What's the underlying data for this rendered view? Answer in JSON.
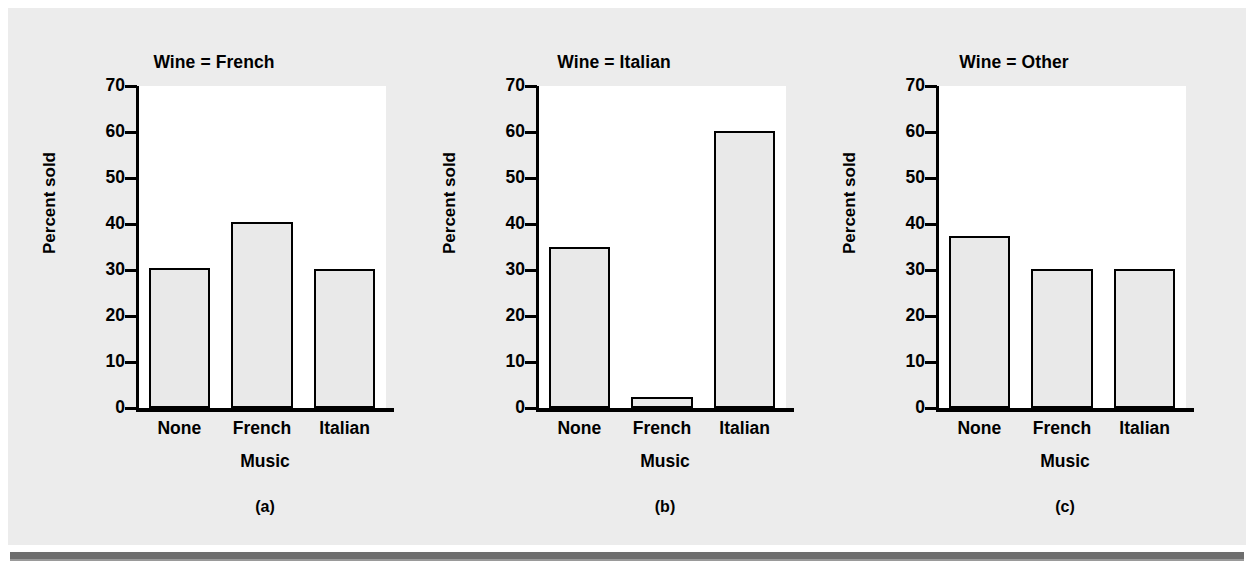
{
  "figure": {
    "background_color": "#ececec",
    "rule_color": "#6e6e6e"
  },
  "chart_data": [
    {
      "type": "bar",
      "title": "Wine = French",
      "panel_letter": "(a)",
      "xlabel": "Music",
      "ylabel": "Percent sold",
      "categories": [
        "None",
        "French",
        "Italian"
      ],
      "values": [
        30.5,
        40.5,
        30.3
      ],
      "ylim": [
        0,
        70
      ],
      "yticks": [
        0,
        10,
        20,
        30,
        40,
        50,
        60,
        70
      ],
      "grid": false,
      "legend": "none",
      "bar_fill": "#e9e9e9",
      "bar_edge": "#000000"
    },
    {
      "type": "bar",
      "title": "Wine = Italian",
      "panel_letter": "(b)",
      "xlabel": "Music",
      "ylabel": "Percent sold",
      "categories": [
        "None",
        "French",
        "Italian"
      ],
      "values": [
        35.0,
        2.5,
        60.3
      ],
      "ylim": [
        0,
        70
      ],
      "yticks": [
        0,
        10,
        20,
        30,
        40,
        50,
        60,
        70
      ],
      "grid": false,
      "legend": "none",
      "bar_fill": "#e9e9e9",
      "bar_edge": "#000000"
    },
    {
      "type": "bar",
      "title": "Wine = Other",
      "panel_letter": "(c)",
      "xlabel": "Music",
      "ylabel": "Percent sold",
      "categories": [
        "None",
        "French",
        "Italian"
      ],
      "values": [
        37.5,
        30.3,
        30.2
      ],
      "ylim": [
        0,
        70
      ],
      "yticks": [
        0,
        10,
        20,
        30,
        40,
        50,
        60,
        70
      ],
      "grid": false,
      "legend": "none",
      "bar_fill": "#e9e9e9",
      "bar_edge": "#000000"
    }
  ]
}
